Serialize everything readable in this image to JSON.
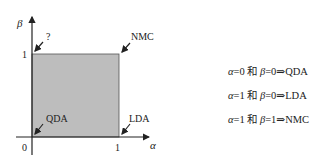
{
  "diagram": {
    "x_axis_label": "α",
    "y_axis_label": "β",
    "origin_label": "0",
    "x_tick_label": "1",
    "y_tick_label": "1",
    "region_fill": "#bdbdbd",
    "corners": {
      "top_left": "?",
      "top_right": "NMC",
      "bottom_left": "QDA",
      "bottom_right": "LDA"
    }
  },
  "equations": [
    {
      "alpha": "α",
      "a_val": "=0",
      "conj": " 和 ",
      "beta": "β",
      "b_val": "=0",
      "implies": "⇒",
      "result": "QDA"
    },
    {
      "alpha": "α",
      "a_val": "=1",
      "conj": " 和 ",
      "beta": "β",
      "b_val": "=0",
      "implies": "⇒",
      "result": "LDA"
    },
    {
      "alpha": "α",
      "a_val": "=1",
      "conj": " 和 ",
      "beta": "β",
      "b_val": "=1",
      "implies": "⇒",
      "result": "NMC"
    }
  ]
}
